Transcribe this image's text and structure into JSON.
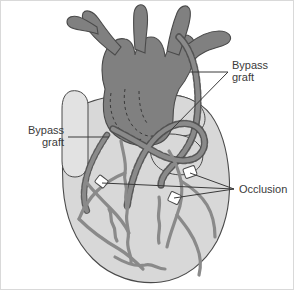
{
  "figure": {
    "view": "anterior",
    "background_color": "#ffffff",
    "border_color": "#d9d9d9",
    "width": 294,
    "height": 290
  },
  "palette": {
    "great_vessel_dark_gray": "#808080",
    "ventricle_light_gray": "#d8d8d8",
    "appendage_pale_gray": "#e2e2e2",
    "coronary_vessel_gray": "#8a8a8a",
    "graft_gray": "#8a8a8a",
    "outline_dark": "#4a4a4a",
    "occlusion_white": "#ffffff",
    "label_text": "#3a3a3a",
    "leader_line": "#3a3a3a"
  },
  "labels": [
    {
      "id": "bypass-graft-right",
      "lines": [
        "Bypass",
        "graft"
      ],
      "line1": "Bypass",
      "line2": "graft",
      "text_anchor": "start",
      "text_x": 231,
      "text_y": 68,
      "line_height": 12,
      "leader_kind": "two-branch",
      "leader_hub_x": 227,
      "leader_hub_y": 71,
      "targets": [
        {
          "x": 189,
          "y": 71
        },
        {
          "x": 170,
          "y": 129
        }
      ]
    },
    {
      "id": "bypass-graft-left",
      "lines": [
        "Bypass",
        "graft"
      ],
      "line1": "Bypass",
      "line2": "graft",
      "text_anchor": "end",
      "text_x": 63,
      "text_y": 133,
      "line_height": 12,
      "leader_kind": "straight",
      "leader_hub_x": 67,
      "leader_hub_y": 136,
      "targets": [
        {
          "x": 108,
          "y": 136
        }
      ]
    },
    {
      "id": "occlusion",
      "lines": [
        "Occlusion"
      ],
      "line1": "Occlusion",
      "line2": "",
      "text_anchor": "start",
      "text_x": 238,
      "text_y": 192,
      "line_height": 12,
      "leader_kind": "three-branch",
      "leader_hub_x": 233,
      "leader_hub_y": 188,
      "targets": [
        {
          "x": 101,
          "y": 182
        },
        {
          "x": 189,
          "y": 172
        },
        {
          "x": 173,
          "y": 197
        }
      ]
    }
  ],
  "anatomy": {
    "great_vessels": {
      "name": "aorta-and-pulmonary-trunk",
      "fill": "#808080",
      "description": "Dark gray great vessels branching superiorly into arch branches"
    },
    "ventricles": {
      "name": "ventricular-mass",
      "fill": "#d8d8d8",
      "description": "Light gray left and right ventricles forming the heart body"
    },
    "atrial_appendage": {
      "name": "left-atrial-appendage",
      "fill": "#e2e2e2",
      "description": "Pale finger-like appendage on the left margin"
    },
    "grafts": [
      {
        "id": "graft-1",
        "description": "Long graft arcing from aortic arch down the right border to the distal vessel"
      },
      {
        "id": "graft-2",
        "description": "Graft crossing the anterior surface to the left coronary territory"
      }
    ],
    "coronary_arteries": [
      {
        "id": "lad",
        "description": "Left anterior descending with tortuous branches"
      },
      {
        "id": "diagonal",
        "description": "Diagonal branch over the anterior left ventricle"
      },
      {
        "id": "rca",
        "description": "Right coronary artery in the atrioventricular groove"
      },
      {
        "id": "marginal",
        "description": "Marginal branch along the inferior border"
      }
    ],
    "occlusions": [
      {
        "id": "occlusion-1",
        "x": 101,
        "y": 182,
        "description": "Occluded segment of left-sided coronary artery"
      },
      {
        "id": "occlusion-2",
        "x": 189,
        "y": 172,
        "description": "Occluded segment of right coronary artery"
      },
      {
        "id": "occlusion-3",
        "x": 173,
        "y": 197,
        "description": "Occluded segment of descending branch"
      }
    ]
  }
}
